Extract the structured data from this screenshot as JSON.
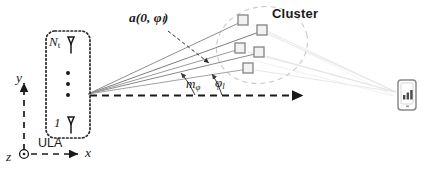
{
  "diagram": {
    "title_visible": false,
    "type": "mmwave-mimo-channel-geometry",
    "colors": {
      "ink": "#1a1a1a",
      "ray_gray": "#9a9a9a",
      "ray_dark": "#6e6e6e",
      "cluster_outline": "#c9c9c9",
      "scatterer_fill": "#f2f2f2",
      "scatterer_stroke": "#8c8c8c",
      "array_box_stroke": "#2a2a2a",
      "device_stroke": "#8a8a8a",
      "faint_ray": "#e2e2e2"
    },
    "labels": {
      "steering_vector": "a(0, φₗ)",
      "steering_vector_parts": {
        "bold_a": "a",
        "open": "(",
        "zero": "0",
        "comma": ",",
        "phi": "φ",
        "sub_l": "l",
        "close": ")"
      },
      "cluster": "Cluster",
      "array_top_symbol": "N",
      "array_top_subscript": "t",
      "array_bottom_symbol": "1",
      "array_name": "ULA",
      "axis_y": "y",
      "axis_x": "x",
      "axis_z": "z",
      "angle_mean": "m",
      "angle_mean_subscript": "φ",
      "angle_path": "φ",
      "angle_path_subscript": "l"
    },
    "elements": {
      "antenna_icon": "dipole-antenna-icon",
      "vertical_dots_count": 3,
      "scatterer_count": 5,
      "ray_count_from_array": 5,
      "receiver_icon": "mobile-handset-signal-icon",
      "signal_bar_count": 3
    },
    "scatterers": [
      {
        "x": 243,
        "y": 20
      },
      {
        "x": 262,
        "y": 30
      },
      {
        "x": 240,
        "y": 48
      },
      {
        "x": 259,
        "y": 52
      },
      {
        "x": 248,
        "y": 68
      }
    ]
  }
}
